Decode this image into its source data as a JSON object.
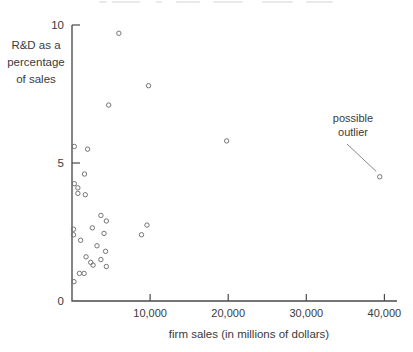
{
  "chart_data": {
    "type": "scatter",
    "title": "",
    "xlabel": "firm sales (in millions of dollars)",
    "ylabel_lines": [
      "R&D as a",
      "percentage",
      "of sales"
    ],
    "x_ticks": [
      {
        "value": 10000,
        "label": "10,000"
      },
      {
        "value": 20000,
        "label": "20,000"
      },
      {
        "value": 30000,
        "label": "30,000"
      },
      {
        "value": 40000,
        "label": "40,000"
      }
    ],
    "y_ticks": [
      {
        "value": 0,
        "label": "0"
      },
      {
        "value": 5,
        "label": "5"
      },
      {
        "value": 10,
        "label": "10"
      }
    ],
    "xlim": [
      0,
      41600
    ],
    "ylim": [
      0,
      10
    ],
    "grid": false,
    "legend": null,
    "marker": "open-circle",
    "points": [
      {
        "x": 6000,
        "y": 9.7
      },
      {
        "x": 9800,
        "y": 7.8
      },
      {
        "x": 4700,
        "y": 7.1
      },
      {
        "x": 19800,
        "y": 5.8
      },
      {
        "x": 300,
        "y": 5.6
      },
      {
        "x": 2000,
        "y": 5.5
      },
      {
        "x": 1600,
        "y": 4.6
      },
      {
        "x": 300,
        "y": 4.25
      },
      {
        "x": 750,
        "y": 4.1
      },
      {
        "x": 750,
        "y": 3.9
      },
      {
        "x": 1700,
        "y": 3.85
      },
      {
        "x": 3700,
        "y": 3.1
      },
      {
        "x": 4400,
        "y": 2.9
      },
      {
        "x": 9600,
        "y": 2.75
      },
      {
        "x": 2600,
        "y": 2.65
      },
      {
        "x": 200,
        "y": 2.6
      },
      {
        "x": 200,
        "y": 2.4
      },
      {
        "x": 8900,
        "y": 2.4
      },
      {
        "x": 4100,
        "y": 2.45
      },
      {
        "x": 1100,
        "y": 2.2
      },
      {
        "x": 3200,
        "y": 2.0
      },
      {
        "x": 4300,
        "y": 1.8
      },
      {
        "x": 1800,
        "y": 1.6
      },
      {
        "x": 3700,
        "y": 1.5
      },
      {
        "x": 2400,
        "y": 1.4
      },
      {
        "x": 2700,
        "y": 1.3
      },
      {
        "x": 4400,
        "y": 1.25
      },
      {
        "x": 950,
        "y": 1.0
      },
      {
        "x": 1550,
        "y": 1.0
      },
      {
        "x": 250,
        "y": 0.7
      },
      {
        "x": 39400,
        "y": 4.5
      }
    ],
    "annotation": {
      "lines": [
        "possible",
        "outlier"
      ],
      "points_to": {
        "x": 39400,
        "y": 4.5
      }
    },
    "colors": {
      "background": "#ffffff",
      "axis": "#4a4a4a",
      "text": "#3a3a3a",
      "marker": "#6e6e6e",
      "annotation_line": "#7a7a7a"
    }
  }
}
